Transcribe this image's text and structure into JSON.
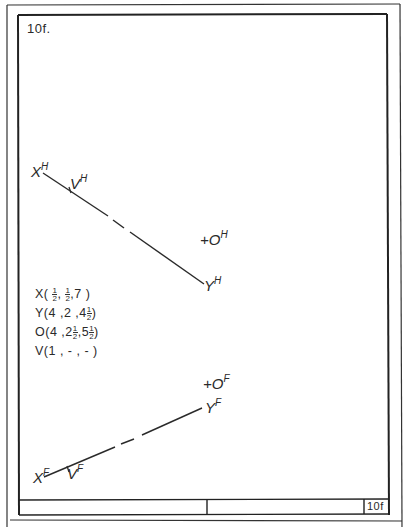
{
  "sheet": {
    "label_top": "10f.",
    "label_title_block": "10f"
  },
  "horizontal_view": {
    "points": [
      {
        "name": "X",
        "superscript": "H"
      },
      {
        "name": "V",
        "superscript": "H"
      },
      {
        "name": "Y",
        "superscript": "H"
      },
      {
        "name": "+O",
        "superscript": "H"
      }
    ]
  },
  "frontal_view": {
    "points": [
      {
        "name": "X",
        "superscript": "F"
      },
      {
        "name": "V",
        "superscript": "F"
      },
      {
        "name": "Y",
        "superscript": "F"
      },
      {
        "name": "+O",
        "superscript": "F"
      }
    ]
  },
  "coordinates": [
    {
      "point": "X",
      "open": "X(",
      "parts": [
        {
          "frac": [
            "1",
            "2"
          ]
        },
        {
          "text": ","
        },
        {
          "frac": [
            "1",
            "2"
          ]
        },
        {
          "text": ",7 )"
        }
      ]
    },
    {
      "point": "Y",
      "text_a": "Y(4 ,2 ,4",
      "frac": [
        "1",
        "2"
      ],
      "text_b": ")"
    },
    {
      "point": "O",
      "text_a": "O(4 ,2",
      "frac1": [
        "1",
        "2"
      ],
      "text_mid": ",5",
      "frac2": [
        "1",
        "2"
      ],
      "text_b": ")"
    },
    {
      "point": "V",
      "text": "V(1 , - , - )"
    }
  ],
  "colors": {
    "ink": "#2a2a2a",
    "paper": "#ffffff"
  }
}
